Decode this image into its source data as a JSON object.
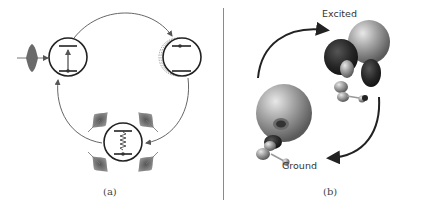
{
  "figure": {
    "panels": [
      {
        "id": "a",
        "caption": "(a)",
        "description": "Cycle of three two-level systems: optical pulse excitation, excited state with recoil, and relaxation emitting phonon/photon wavepackets",
        "nodes": [
          {
            "name": "absorption",
            "center": [
              51,
              57
            ],
            "radius": 19,
            "transition": "upward arrow"
          },
          {
            "name": "excited-recoil",
            "center": [
              180,
              57
            ],
            "radius": 19,
            "transition": "population in upper level, dashed echoes"
          },
          {
            "name": "emission",
            "center": [
              123,
              143
            ],
            "radius": 19,
            "transition": "wavy downward decay"
          }
        ],
        "colors": {
          "line": "#555555",
          "circle": "#222222",
          "pulse": "#6a6a6a"
        }
      },
      {
        "id": "b",
        "caption": "(b)",
        "labels": {
          "excited": "Excited",
          "ground": "Ground"
        },
        "description": "Molecular orbital isosurfaces for excited and ground states connected by cyclic arrows",
        "colors": {
          "lobe_light": "#a8a8a8",
          "lobe_dark": "#2a2a2a",
          "arrow": "#222222"
        }
      }
    ]
  }
}
